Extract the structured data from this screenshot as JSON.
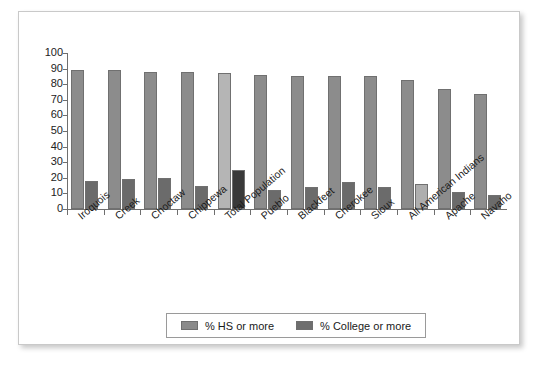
{
  "figure": {
    "caption": "",
    "frame_border_color": "#c9c9c9"
  },
  "legend": {
    "items": [
      {
        "label": "% HS or more",
        "color": "#8a8a8a",
        "icon": "legend-swatch-icon"
      },
      {
        "label": "% College or more",
        "color": "#6e6e6e",
        "icon": "legend-swatch-icon"
      }
    ]
  },
  "colors": {
    "hs_default": "#8c8c8c",
    "college_default": "#6b6b6b",
    "hs_highlight": "#b5b5b5",
    "college_highlight_dark": "#3a3a3a",
    "college_highlight_light": "#aeaeae",
    "axis": "#6f6f6f",
    "text": "#1a1a1a"
  },
  "chart_data": {
    "type": "bar",
    "title": "",
    "xlabel": "",
    "ylabel": "",
    "ylim": [
      0,
      100
    ],
    "yticks": [
      0,
      10,
      20,
      30,
      40,
      50,
      60,
      70,
      80,
      90,
      100
    ],
    "ytick_labels": [
      "0",
      "10",
      "20",
      "30",
      "40",
      "50",
      "60",
      "70",
      "80",
      "90",
      "100"
    ],
    "grid": false,
    "legend_position": "bottom-center",
    "categories": [
      "Iroquois",
      "Creek",
      "Choctaw",
      "Chippewa",
      "Total Population",
      "Pueblo",
      "Blackfeet",
      "Cherokee",
      "Sioux",
      "All American Indians",
      "Apache",
      "Navaho"
    ],
    "series": [
      {
        "name": "% HS or more",
        "values": [
          89,
          89,
          88,
          88,
          87,
          86,
          85,
          85,
          85,
          83,
          77,
          74
        ]
      },
      {
        "name": "% College or more",
        "values": [
          18,
          19,
          20,
          15,
          25,
          12,
          14,
          17,
          14,
          16,
          11,
          9
        ]
      }
    ],
    "highlighted_categories": [
      "Total Population",
      "All American Indians"
    ]
  }
}
